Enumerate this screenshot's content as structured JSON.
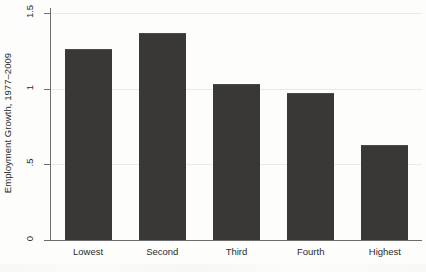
{
  "chart_data": {
    "type": "bar",
    "title": "",
    "xlabel": "",
    "ylabel": "Employment Growth, 1977–2009",
    "categories": [
      "Lowest",
      "Second",
      "Third",
      "Fourth",
      "Highest"
    ],
    "values": [
      1.26,
      1.37,
      1.03,
      0.97,
      0.63
    ],
    "ylim": [
      0,
      1.5
    ],
    "ytick_labels": [
      "0",
      ".5",
      "1",
      "1.5"
    ],
    "ytick_values": [
      0,
      0.5,
      1,
      1.5
    ],
    "grid": true,
    "legend": "none",
    "bar_color": "#3a3836",
    "axis_color": "#6d6d6d",
    "grid_color": "#e9e9e5",
    "background_color": "#fdfdfc",
    "text_color": "#2b2b2b"
  }
}
